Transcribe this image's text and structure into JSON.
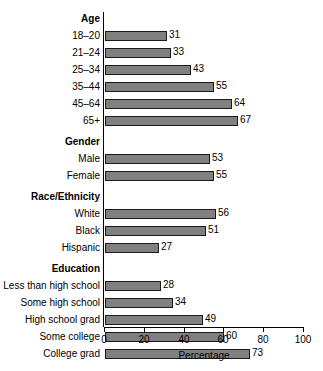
{
  "chart_data": {
    "type": "bar",
    "orientation": "horizontal",
    "title": "",
    "xlabel": "Percentage",
    "ylabel": "",
    "xlim": [
      0,
      100
    ],
    "xticks": [
      0,
      20,
      40,
      60,
      80,
      100
    ],
    "xtick_labels": [
      "0",
      "20",
      "40",
      "60",
      "80",
      "100"
    ],
    "grid": false,
    "legend": null,
    "bar_color": "#808080",
    "bar_edge_color": "#1a1a1a",
    "groups": [
      {
        "name": "Age",
        "categories": [
          "18–20",
          "21–24",
          "25–34",
          "35–44",
          "45–64",
          "65+"
        ],
        "values": [
          31,
          33,
          43,
          55,
          64,
          67
        ]
      },
      {
        "name": "Gender",
        "categories": [
          "Male",
          "Female"
        ],
        "values": [
          53,
          55
        ]
      },
      {
        "name": "Race/Ethnicity",
        "categories": [
          "White",
          "Black",
          "Hispanic"
        ],
        "values": [
          56,
          51,
          27
        ]
      },
      {
        "name": "Education",
        "categories": [
          "Less than high school",
          "Some high school",
          "High school grad",
          "Some college",
          "College grad"
        ],
        "values": [
          28,
          34,
          49,
          60,
          73
        ]
      }
    ],
    "categories": [
      "18–20",
      "21–24",
      "25–34",
      "35–44",
      "45–64",
      "65+",
      "Male",
      "Female",
      "White",
      "Black",
      "Hispanic",
      "Less than high school",
      "Some high school",
      "High school grad",
      "Some college",
      "College grad"
    ],
    "values": [
      31,
      33,
      43,
      55,
      64,
      67,
      53,
      55,
      56,
      51,
      27,
      28,
      34,
      49,
      60,
      73
    ]
  }
}
